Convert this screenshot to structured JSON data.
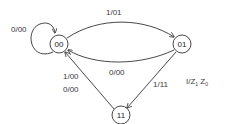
{
  "diagram": {
    "type": "state-machine",
    "states": [
      {
        "id": "s00",
        "label": "00"
      },
      {
        "id": "s01",
        "label": "01"
      },
      {
        "id": "s11",
        "label": "11"
      }
    ],
    "transitions": [
      {
        "from": "00",
        "to": "00",
        "label": "0/00"
      },
      {
        "from": "00",
        "to": "01",
        "label": "1/01"
      },
      {
        "from": "01",
        "to": "00",
        "label": "0/00"
      },
      {
        "from": "01",
        "to": "11",
        "label": "1/11"
      },
      {
        "from": "11",
        "to": "00",
        "labels": [
          "1/00",
          "0/00"
        ]
      }
    ],
    "legend": {
      "text": "I/Z",
      "sub1": "1",
      "sep": " Z",
      "sub0": "0"
    }
  }
}
